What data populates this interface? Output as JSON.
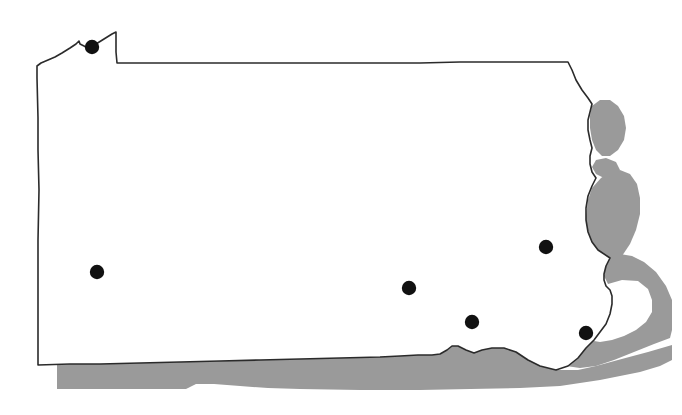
{
  "map": {
    "title": "Pennsylvania state outline map with city markers",
    "region_name": "Pennsylvania",
    "width": 682,
    "height": 415,
    "background_color": "#ffffff",
    "state_fill_color": "#ffffff",
    "state_border_color": "#2b2b2b",
    "state_border_width": 1.6,
    "neighbor_band_color": "#9a9a9a",
    "marker_color": "#111111",
    "marker_radius": 7.2,
    "neighbor_bands": [
      {
        "name": "southern-border-band",
        "label": "Maryland / West Virginia border band",
        "fill": "#9a9a9a",
        "path": "M 57,365 L 57,389 L 186,389 L 196,384 L 214,384 L 240,386 L 268,388 L 300,389 L 360,390 L 420,390 L 470,389 L 520,388 L 560,386 L 600,380 L 640,372 L 660,366 L 672,360 L 672,345 L 648,352 L 618,360 L 596,366 L 578,370 L 556,370 L 540,366 L 528,360 L 516,352 L 504,348 L 492,348 L 482,350 L 474,353 L 466,350 L 458,346 L 452,346 L 447,350 L 440,354 L 432,355 L 418,355 L 400,356 L 380,357 L 340,358 L 300,359 L 260,360 L 220,361 L 180,362 L 140,363 L 100,364 L 70,364 Z"
      },
      {
        "name": "delaware-river-band-lower",
        "label": "Delaware River band (lower east)",
        "fill": "#9a9a9a",
        "path": "M 608,284 L 622,280 L 638,281 L 648,289 L 652,300 L 652,312 L 646,322 L 636,330 L 624,336 L 612,340 L 600,342 L 588,340 L 578,336 L 568,334 L 556,336 L 546,341 L 538,346 L 532,350 L 540,356 L 552,362 L 566,366 L 580,368 L 596,366 L 614,360 L 634,352 L 654,344 L 670,338 L 672,330 L 672,300 L 666,286 L 656,272 L 644,262 L 632,256 L 620,254 L 612,258 L 606,266 L 604,276 Z"
      },
      {
        "name": "delaware-river-band-mid",
        "label": "Delaware River band (middle east)",
        "fill": "#9a9a9a",
        "path": "M 601,178 L 610,172 L 620,170 L 630,174 L 637,184 L 640,198 L 640,214 L 636,230 L 630,244 L 622,256 L 614,264 L 606,268 L 598,266 L 592,258 L 588,246 L 586,232 L 586,216 L 588,200 L 592,188 Z"
      },
      {
        "name": "delaware-river-band-upper",
        "label": "Delaware River band (upper east)",
        "fill": "#9a9a9a",
        "path": "M 592,106 L 600,100 L 610,100 L 618,106 L 624,116 L 626,128 L 624,140 L 618,150 L 610,156 L 602,156 L 596,150 L 592,140 L 590,128 L 590,116 Z"
      },
      {
        "name": "delaware-river-band-notch",
        "label": "Delaware River band near Easton notch",
        "fill": "#9a9a9a",
        "path": "M 596,160 L 606,158 L 616,162 L 620,170 L 614,176 L 604,178 L 596,174 L 592,167 Z"
      }
    ],
    "state_outline": {
      "name": "pennsylvania-outline",
      "path": "M 37,66 L 37,78 L 38,118 L 38,150 L 39,190 L 38,240 L 38,290 L 38,330 L 38,365 L 70,364 L 100,364 L 140,363 L 180,362 L 220,361 L 260,360 L 300,359 L 340,358 L 380,357 L 400,356 L 418,355 L 432,355 L 440,354 L 447,350 L 452,346 L 458,346 L 466,350 L 474,353 L 482,350 L 492,348 L 504,348 L 516,352 L 528,360 L 540,366 L 556,370 L 568,366 L 578,358 L 586,348 L 594,340 L 600,332 L 606,324 L 610,314 L 612,304 L 612,296 L 610,290 L 606,286 L 604,280 L 604,274 L 606,266 L 610,258 L 598,250 L 592,242 L 588,232 L 586,220 L 586,208 L 588,196 L 592,186 L 596,178 L 592,172 L 590,164 L 590,156 L 592,148 L 590,140 L 588,130 L 588,120 L 590,112 L 592,104 L 588,98 L 582,90 L 576,80 L 572,70 L 568,62 L 540,62 L 500,62 L 460,62 L 420,63 L 380,63 L 340,63 L 300,63 L 260,63 L 220,63 L 180,63 L 150,63 L 117,63 L 116,52 L 116,42 L 116,32 L 112,34 L 104,39 L 96,44 L 88,48 L 80,44 L 79,41 L 76,44 L 70,48 L 62,53 L 55,57 L 48,60 L 41,63 Z"
    },
    "city_markers": [
      {
        "name": "city-marker-erie",
        "label": "Erie",
        "cx": 92,
        "cy": 47,
        "r": 7.2
      },
      {
        "name": "city-marker-pittsburgh",
        "label": "Pittsburgh",
        "cx": 97,
        "cy": 272,
        "r": 7.2
      },
      {
        "name": "city-marker-harrisburg",
        "label": "Harrisburg",
        "cx": 409,
        "cy": 288,
        "r": 7.2
      },
      {
        "name": "city-marker-scranton-allentown",
        "label": "Scranton / Allentown",
        "cx": 546,
        "cy": 247,
        "r": 7.2
      },
      {
        "name": "city-marker-lancaster-york",
        "label": "Lancaster / York",
        "cx": 472,
        "cy": 322,
        "r": 7.2
      },
      {
        "name": "city-marker-philadelphia",
        "label": "Philadelphia",
        "cx": 586,
        "cy": 333,
        "r": 7.2
      }
    ]
  }
}
